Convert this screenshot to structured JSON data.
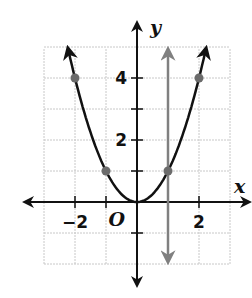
{
  "chart_data": {
    "type": "line",
    "title": "",
    "xlabel": "x",
    "ylabel": "y",
    "origin_label": "O",
    "xlim": [
      -3,
      3
    ],
    "ylim": [
      -2,
      5
    ],
    "grid": true,
    "x_tick_labels": [
      {
        "value": -2,
        "label": "−2"
      },
      {
        "value": 2,
        "label": "2"
      }
    ],
    "y_tick_labels": [
      {
        "value": 2,
        "label": "2"
      },
      {
        "value": 4,
        "label": "4"
      }
    ],
    "series": [
      {
        "name": "y = x^2",
        "kind": "parabola",
        "color": "#111111",
        "x": [
          -2.2,
          -2,
          -1,
          0,
          1,
          2,
          2.2
        ],
        "y": [
          4.84,
          4,
          1,
          0,
          1,
          4,
          4.84
        ]
      },
      {
        "name": "x = 1",
        "kind": "vertical-line",
        "color": "#808080",
        "x_value": 1,
        "y_range": [
          -1.8,
          4.8
        ]
      }
    ],
    "points": [
      {
        "x": -2,
        "y": 4
      },
      {
        "x": -1,
        "y": 1
      },
      {
        "x": 1,
        "y": 1
      },
      {
        "x": 2,
        "y": 4
      }
    ],
    "point_color": "#6b6b6b",
    "grid_color": "#c8c8c8",
    "axis_color": "#111111"
  }
}
